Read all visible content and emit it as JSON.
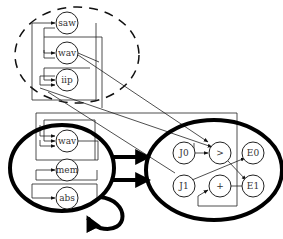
{
  "diagram": {
    "type": "nested-graph",
    "groups": [
      {
        "id": "top-group",
        "style": "dashed",
        "nodes": [
          "saw",
          "wav",
          "iip"
        ]
      },
      {
        "id": "left-group",
        "style": "bold",
        "nodes": [
          "wav",
          "mem",
          "abs"
        ]
      },
      {
        "id": "right-group",
        "style": "bold",
        "nodes": [
          "J0",
          ">",
          "E0",
          "J1",
          "+",
          "E1"
        ]
      }
    ],
    "nodes": {
      "top": [
        {
          "id": "saw",
          "label": "saw"
        },
        {
          "id": "wav_top",
          "label": "wav"
        },
        {
          "id": "iip",
          "label": "iip"
        }
      ],
      "left": [
        {
          "id": "wav_bottom",
          "label": "wav"
        },
        {
          "id": "mem",
          "label": "mem"
        },
        {
          "id": "abs",
          "label": "abs"
        }
      ],
      "right": [
        {
          "id": "J0",
          "label": "J0"
        },
        {
          "id": "gt",
          "label": ">"
        },
        {
          "id": "E0",
          "label": "E0"
        },
        {
          "id": "J1",
          "label": "J1"
        },
        {
          "id": "plus",
          "label": "+"
        },
        {
          "id": "E1",
          "label": "E1"
        }
      ]
    },
    "edges": [
      {
        "from": "left-group",
        "to": "right-group",
        "style": "thick",
        "count": 2
      },
      {
        "from": "left-group",
        "to": "left-group",
        "style": "thick-self-loop"
      },
      {
        "from": "J0",
        "to": ">"
      },
      {
        "from": ">",
        "to": "E1"
      },
      {
        "from": "J1",
        "to": "E0"
      },
      {
        "from": "+",
        "to": "E1"
      },
      {
        "from": "J1",
        "to": "+"
      },
      {
        "from": "wav_top",
        "to": ">"
      }
    ]
  }
}
